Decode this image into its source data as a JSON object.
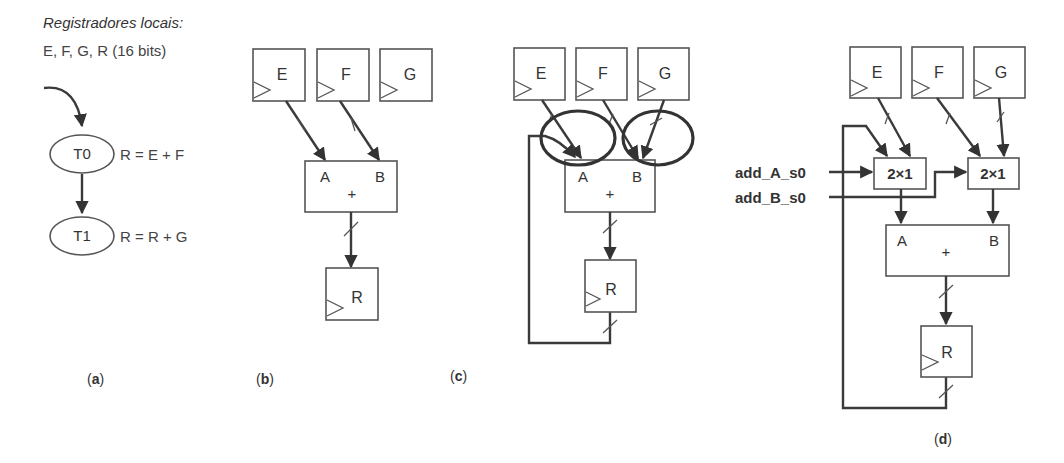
{
  "part_a": {
    "heading": "Registradores locais:",
    "registers_line": "E, F, G, R (16 bits)",
    "states": [
      {
        "name": "T0",
        "action": "R = E + F"
      },
      {
        "name": "T1",
        "action": "R = R + G"
      }
    ],
    "caption_open": "(",
    "caption_letter": "a",
    "caption_close": ")"
  },
  "part_b": {
    "registers": [
      "E",
      "F",
      "G"
    ],
    "adder": {
      "input_a": "A",
      "input_b": "B",
      "op": "+"
    },
    "output_register": "R",
    "caption_letter": "b"
  },
  "part_c": {
    "registers": [
      "E",
      "F",
      "G"
    ],
    "adder": {
      "input_a": "A",
      "input_b": "B",
      "op": "+"
    },
    "output_register": "R",
    "caption_letter": "c",
    "highlight": "conflicting inputs circled at A and B"
  },
  "part_d": {
    "registers": [
      "E",
      "F",
      "G"
    ],
    "muxes": [
      {
        "label": "2×1"
      },
      {
        "label": "2×1"
      }
    ],
    "control_signals": [
      "add_A_s0",
      "add_B_s0"
    ],
    "adder": {
      "input_a": "A",
      "input_b": "B",
      "op": "+"
    },
    "output_register": "R",
    "caption_letter": "d"
  }
}
